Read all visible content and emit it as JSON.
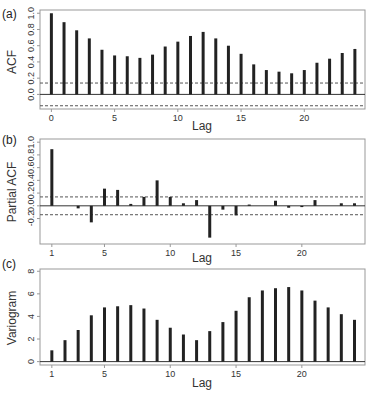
{
  "chart_data": [
    {
      "panel": "(a)",
      "type": "bar",
      "title": "",
      "xlabel": "Lag",
      "ylabel": "ACF",
      "x": [
        0,
        1,
        2,
        3,
        4,
        5,
        6,
        7,
        8,
        9,
        10,
        11,
        12,
        13,
        14,
        15,
        16,
        17,
        18,
        19,
        20,
        21,
        22,
        23,
        24
      ],
      "values": [
        1.0,
        0.89,
        0.79,
        0.69,
        0.55,
        0.48,
        0.47,
        0.45,
        0.49,
        0.59,
        0.65,
        0.72,
        0.77,
        0.69,
        0.6,
        0.5,
        0.37,
        0.3,
        0.28,
        0.26,
        0.3,
        0.39,
        0.44,
        0.51,
        0.56
      ],
      "confidence_bounds": [
        0.14,
        -0.14
      ],
      "xticks": [
        "0",
        "5",
        "10",
        "15",
        "20"
      ],
      "xtick_values": [
        0,
        5,
        10,
        15,
        20
      ],
      "yticks": [
        "0.0",
        "0.2",
        "0.4",
        "0.6",
        "0.8",
        "1.0"
      ],
      "ytick_values": [
        0.0,
        0.2,
        0.4,
        0.6,
        0.8,
        1.0
      ],
      "ylim": [
        -0.18,
        1.04
      ],
      "xlim": [
        -0.9,
        24.8
      ],
      "grid": false
    },
    {
      "panel": "(b)",
      "type": "bar",
      "title": "",
      "xlabel": "Lag",
      "ylabel": "Partial ACF",
      "x": [
        1,
        2,
        3,
        4,
        5,
        6,
        7,
        8,
        9,
        10,
        11,
        12,
        13,
        14,
        15,
        16,
        17,
        18,
        19,
        20,
        21,
        22,
        23,
        24
      ],
      "values": [
        0.89,
        0.0,
        -0.04,
        -0.26,
        0.27,
        0.25,
        0.03,
        0.14,
        0.4,
        0.14,
        0.04,
        0.09,
        -0.5,
        -0.06,
        -0.15,
        0.02,
        0.0,
        0.08,
        -0.03,
        -0.02,
        0.09,
        0.0,
        0.04,
        0.04
      ],
      "confidence_bounds": [
        0.14,
        -0.14
      ],
      "xticks": [
        "1",
        "5",
        "10",
        "15",
        "20"
      ],
      "xtick_values": [
        1,
        5,
        10,
        15,
        20
      ],
      "yticks": [
        "-0.2",
        "0.0",
        "0.2",
        "0.4",
        "0.6",
        "0.8",
        "1.0"
      ],
      "ytick_values": [
        -0.2,
        0.0,
        0.2,
        0.4,
        0.6,
        0.8,
        1.0
      ],
      "ylim": [
        -0.6,
        1.05
      ],
      "xlim": [
        0.1,
        24.8
      ],
      "grid": false
    },
    {
      "panel": "(c)",
      "type": "bar",
      "title": "",
      "xlabel": "Lag",
      "ylabel": "Variogram",
      "x": [
        1,
        2,
        3,
        4,
        5,
        6,
        7,
        8,
        9,
        10,
        11,
        12,
        13,
        14,
        15,
        16,
        17,
        18,
        19,
        20,
        21,
        22,
        23,
        24
      ],
      "values": [
        1.0,
        1.9,
        2.8,
        4.1,
        4.8,
        4.9,
        5.0,
        4.7,
        3.7,
        3.0,
        2.4,
        1.9,
        2.7,
        3.5,
        4.5,
        5.7,
        6.3,
        6.5,
        6.6,
        6.3,
        5.4,
        4.8,
        4.2,
        3.7
      ],
      "xticks": [
        "1",
        "5",
        "10",
        "15",
        "20"
      ],
      "xtick_values": [
        1,
        5,
        10,
        15,
        20
      ],
      "yticks": [
        "0",
        "2",
        "4",
        "6",
        "8"
      ],
      "ytick_values": [
        0,
        2,
        4,
        6,
        8
      ],
      "ylim": [
        -0.3,
        8.2
      ],
      "xlim": [
        0.1,
        24.8
      ],
      "grid": false
    }
  ],
  "labels": {
    "panel_a": "(a)",
    "panel_b": "(b)",
    "panel_c": "(c)",
    "a_ylabel": "ACF",
    "b_ylabel": "Partial ACF",
    "c_ylabel": "Variogram",
    "xlabel": "Lag"
  }
}
